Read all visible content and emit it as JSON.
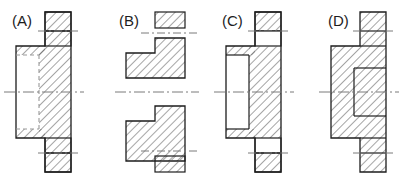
{
  "sheet": {
    "title": "Multiple-choice flange section views",
    "background_color": "#ffffff",
    "line_color": "#1d1d1d",
    "hatch_color": "#5a5a5a",
    "centerline_color": "#7a7a7a",
    "hidden_line_color": "#9a9a9a",
    "width": 413,
    "height": 184
  },
  "options": [
    {
      "id": "A",
      "label": "(A)",
      "label_x": 12,
      "label_y": 26,
      "description": "Flange half-section with hidden (dashed) bore outline and unhatched bore on left hub",
      "hatched": "partial",
      "has_hidden_lines": true
    },
    {
      "id": "B",
      "label": "(B)",
      "label_x": 119,
      "label_y": 26,
      "description": "Exploded half view: detached rim blocks top and bottom with stepped hub bodies",
      "hatched": "partial",
      "has_hidden_lines": false
    },
    {
      "id": "C",
      "label": "(C)",
      "label_x": 222,
      "label_y": 26,
      "description": "Flange section with open unhatched bore through hub and no hidden lines",
      "hatched": "partial",
      "has_hidden_lines": false
    },
    {
      "id": "D",
      "label": "(D)",
      "label_x": 328,
      "label_y": 26,
      "description": "Flange section fully hatched across bore area",
      "hatched": "full",
      "has_hidden_lines": false
    }
  ],
  "geometry": {
    "A": {
      "origin_x": 16,
      "rim_left": 45,
      "rim_right": 71,
      "hub_left": 16,
      "hub_right": 45,
      "top": 12,
      "bottom": 172,
      "hub_top": 46,
      "hub_bottom": 138,
      "bore_left": 16,
      "bore_right": 39,
      "bore_top": 55,
      "bore_bottom": 129,
      "center_y": 92,
      "bolt_top_y": 31,
      "bolt_bottom_y": 153
    },
    "B": {
      "rim_left": 155,
      "rim_right": 185,
      "hub_left": 126,
      "hub_right": 185,
      "top_block_top": 12,
      "top_block_bottom": 28,
      "upper_body_top": 38,
      "upper_body_bottom": 78,
      "upper_step_y": 53,
      "upper_step_x": 155,
      "lower_body_top": 106,
      "lower_body_bottom": 146,
      "lower_step_y": 131,
      "bottom_block_top": 156,
      "bottom_block_bottom": 172,
      "center_y": 92,
      "gap_top_y": 33,
      "gap_bottom_y": 151
    },
    "C": {
      "rim_left": 255,
      "rim_right": 281,
      "hub_left": 226,
      "hub_right": 255,
      "top": 12,
      "bottom": 172,
      "hub_top": 46,
      "hub_bottom": 138,
      "bore_left": 226,
      "bore_right": 249,
      "bore_top": 55,
      "bore_bottom": 129,
      "center_y": 92,
      "bolt_top_y": 31,
      "bolt_bottom_y": 153
    },
    "D": {
      "rim_left": 360,
      "rim_right": 386,
      "hub_left": 331,
      "hub_right": 360,
      "top": 12,
      "bottom": 172,
      "hub_top": 46,
      "hub_bottom": 138,
      "bore_left": 331,
      "bore_right": 354,
      "bore_top": 55,
      "bore_bottom": 129,
      "center_y": 92,
      "bolt_top_y": 31,
      "bolt_bottom_y": 153
    }
  }
}
